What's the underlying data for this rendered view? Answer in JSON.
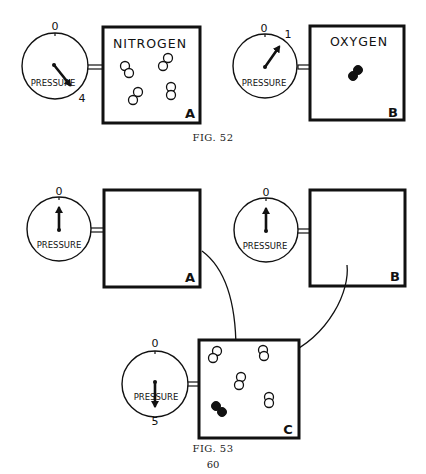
{
  "figures": [
    {
      "caption": "Fig. 52",
      "containers": [
        {
          "id": "A",
          "gas": "NITROGEN",
          "pressure_label": "PRESSURE",
          "dial_zero": "0",
          "dial_reading": "4",
          "molecules": {
            "nitrogen": 4,
            "oxygen": 0
          }
        },
        {
          "id": "B",
          "gas": "OXYGEN",
          "pressure_label": "PRESSURE",
          "dial_zero": "0",
          "dial_reading": "1",
          "molecules": {
            "nitrogen": 0,
            "oxygen": 1
          }
        }
      ]
    },
    {
      "caption": "Fig. 53",
      "containers": [
        {
          "id": "A",
          "gas": "",
          "pressure_label": "PRESSURE",
          "dial_zero": "0",
          "dial_reading": "0",
          "molecules": {
            "nitrogen": 0,
            "oxygen": 0
          }
        },
        {
          "id": "B",
          "gas": "",
          "pressure_label": "PRESSURE",
          "dial_zero": "0",
          "dial_reading": "0",
          "molecules": {
            "nitrogen": 0,
            "oxygen": 0
          }
        },
        {
          "id": "C",
          "gas": "",
          "pressure_label": "PRESSURE",
          "dial_zero": "0",
          "dial_reading": "5",
          "molecules": {
            "nitrogen": 4,
            "oxygen": 1
          }
        }
      ],
      "arrows": [
        {
          "from": "A",
          "to": "C"
        },
        {
          "from": "B",
          "to": "C"
        }
      ]
    }
  ],
  "page_number": "60"
}
